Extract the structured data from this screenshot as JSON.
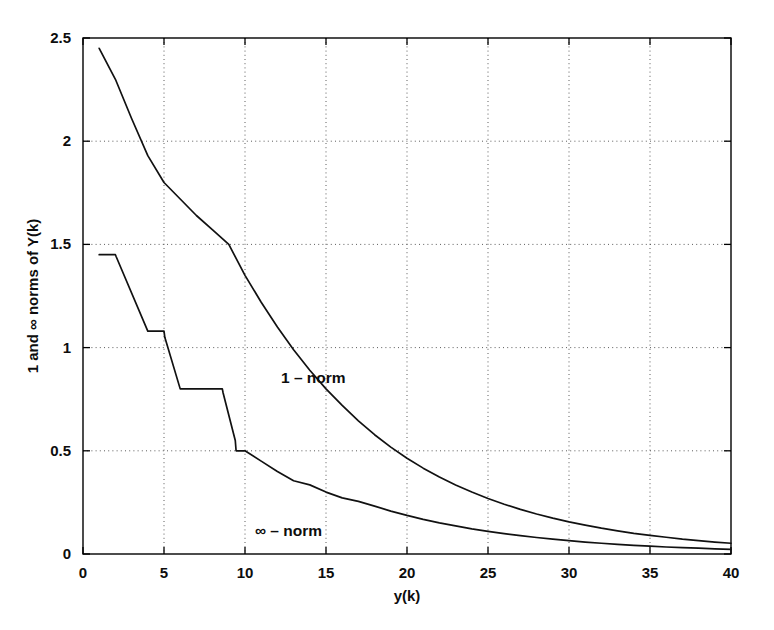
{
  "chart_data": {
    "type": "line",
    "title": "",
    "xlabel": "y(k)",
    "ylabel": "1 and ∞ norms of Y(k)",
    "xlim": [
      0,
      40
    ],
    "ylim": [
      0,
      2.5
    ],
    "xticks": [
      0,
      5,
      10,
      15,
      20,
      25,
      30,
      35,
      40
    ],
    "xticklabels": [
      "0",
      "5",
      "10",
      "15",
      "20",
      "25",
      "30",
      "35",
      "40"
    ],
    "yticks": [
      0,
      0.5,
      1,
      1.5,
      2,
      2.5
    ],
    "yticklabels": [
      "0",
      "0.5",
      "1",
      "1.5",
      "2",
      "2.5"
    ],
    "grid": "dotted",
    "legend_position": "inline-annotations",
    "background": "#ffffff",
    "line_color": "#111111",
    "series": [
      {
        "name": "1 - norm",
        "annotation_label": "1 – norm",
        "annotation_x": 12.2,
        "annotation_y": 0.93,
        "x": [
          1,
          2,
          3,
          4,
          5,
          6,
          7,
          8,
          9,
          10,
          11,
          12,
          13,
          14,
          15,
          16,
          17,
          18,
          19,
          20,
          21,
          22,
          23,
          24,
          25,
          26,
          27,
          28,
          29,
          30,
          31,
          32,
          33,
          34,
          35,
          36,
          37,
          38,
          39,
          40
        ],
        "values": [
          2.45,
          2.3,
          2.11,
          1.93,
          1.8,
          1.72,
          1.64,
          1.57,
          1.5,
          1.35,
          1.22,
          1.1,
          0.99,
          0.89,
          0.8,
          0.72,
          0.645,
          0.578,
          0.518,
          0.464,
          0.416,
          0.373,
          0.334,
          0.3,
          0.269,
          0.241,
          0.216,
          0.194,
          0.174,
          0.156,
          0.14,
          0.125,
          0.112,
          0.1,
          0.09,
          0.081,
          0.072,
          0.065,
          0.058,
          0.052
        ]
      },
      {
        "name": "inf - norm",
        "annotation_label": "∞ – norm",
        "annotation_x": 10.6,
        "annotation_y": 0.18,
        "x": [
          1,
          2,
          2.05,
          4,
          4.05,
          5,
          5.05,
          6,
          6.05,
          8.6,
          8.65,
          9.4,
          9.45,
          10,
          11,
          12,
          13,
          14,
          15,
          16,
          17,
          18,
          19,
          20,
          21,
          22,
          23,
          24,
          25,
          26,
          27,
          28,
          29,
          30,
          31,
          32,
          33,
          34,
          35,
          36,
          37,
          38,
          39,
          40
        ],
        "values": [
          1.45,
          1.45,
          1.44,
          1.08,
          1.08,
          1.08,
          1.05,
          0.8,
          0.8,
          0.8,
          0.78,
          0.55,
          0.5,
          0.5,
          0.45,
          0.4,
          0.355,
          0.335,
          0.3,
          0.272,
          0.255,
          0.232,
          0.208,
          0.187,
          0.168,
          0.151,
          0.136,
          0.122,
          0.11,
          0.099,
          0.089,
          0.08,
          0.072,
          0.065,
          0.058,
          0.052,
          0.047,
          0.042,
          0.038,
          0.034,
          0.031,
          0.028,
          0.025,
          0.022
        ]
      }
    ]
  },
  "figure": {
    "xlabel": "y(k)",
    "ylabel": "1 and ∞ norms of Y(k)",
    "annotation_one_norm": "1 – norm",
    "annotation_inf_norm": "∞ – norm"
  }
}
